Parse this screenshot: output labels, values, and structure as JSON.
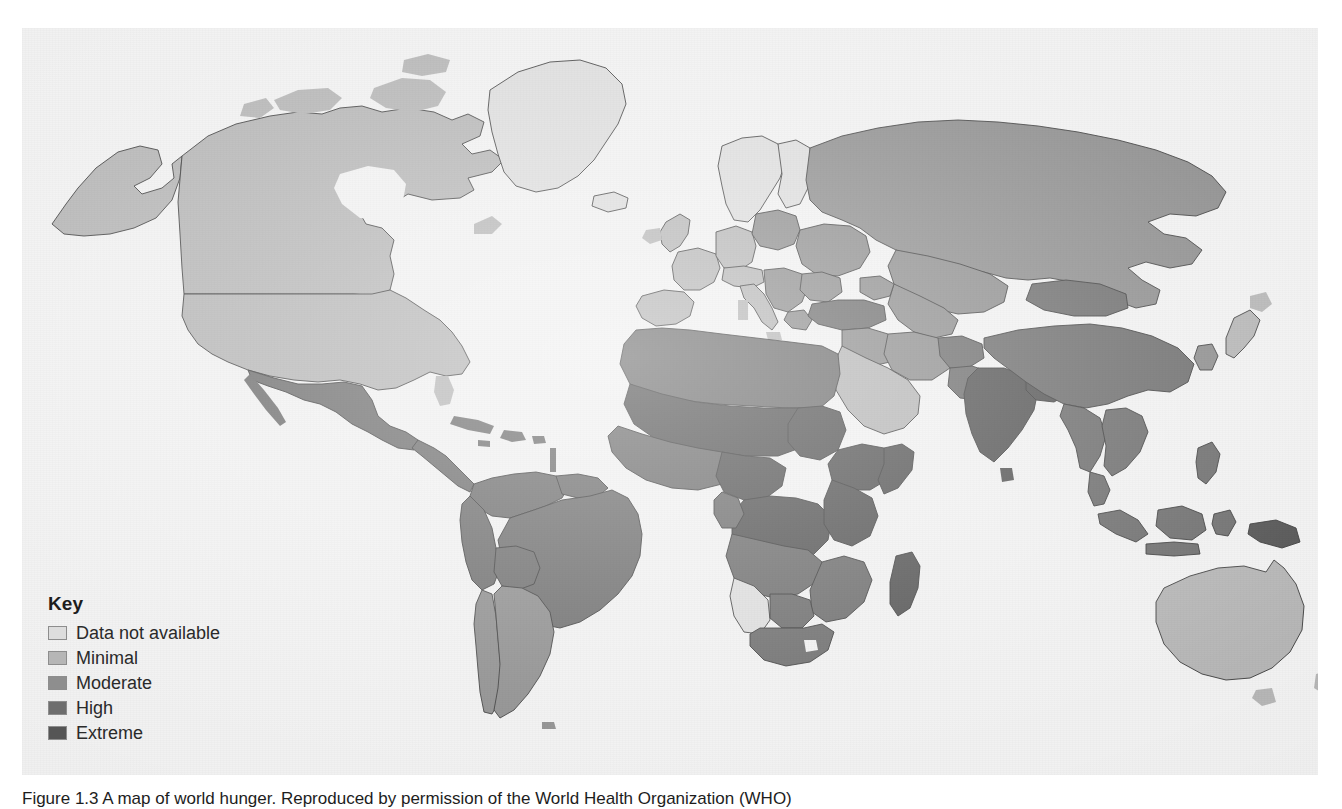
{
  "figure": {
    "caption": "Figure 1.3 A map of world hunger. Reproduced by permission of the World Health Organization (WHO)"
  },
  "legend": {
    "title": "Key",
    "items": [
      {
        "label": "Data not available",
        "color": "#dddddd"
      },
      {
        "label": "Minimal",
        "color": "#b6b6b6"
      },
      {
        "label": "Moderate",
        "color": "#8e8e8e"
      },
      {
        "label": "High",
        "color": "#6e6e6e"
      },
      {
        "label": "Extreme",
        "color": "#555555"
      }
    ]
  },
  "map": {
    "type": "choropleth-world",
    "background_color": "#f1f1f1",
    "ocean_color": "#f1f1f1",
    "border_color": "#3a3a3a",
    "categories": [
      "Data not available",
      "Minimal",
      "Moderate",
      "High",
      "Extreme"
    ],
    "regions": [
      {
        "name": "Greenland",
        "category": "Data not available"
      },
      {
        "name": "Iceland",
        "category": "Data not available"
      },
      {
        "name": "Canada",
        "category": "Minimal"
      },
      {
        "name": "Alaska",
        "category": "Minimal"
      },
      {
        "name": "United States",
        "category": "Minimal"
      },
      {
        "name": "Mexico",
        "category": "High"
      },
      {
        "name": "Central America",
        "category": "High"
      },
      {
        "name": "Caribbean",
        "category": "High"
      },
      {
        "name": "Venezuela",
        "category": "High"
      },
      {
        "name": "Colombia",
        "category": "High"
      },
      {
        "name": "Brazil",
        "category": "High"
      },
      {
        "name": "Peru",
        "category": "High"
      },
      {
        "name": "Bolivia",
        "category": "High"
      },
      {
        "name": "Chile",
        "category": "Moderate"
      },
      {
        "name": "Argentina",
        "category": "Moderate"
      },
      {
        "name": "Scandinavia",
        "category": "Data not available"
      },
      {
        "name": "Western Europe",
        "category": "Minimal"
      },
      {
        "name": "Eastern Europe",
        "category": "Moderate"
      },
      {
        "name": "Balkans",
        "category": "Moderate"
      },
      {
        "name": "Russia",
        "category": "Moderate"
      },
      {
        "name": "Turkey",
        "category": "High"
      },
      {
        "name": "North Africa",
        "category": "High"
      },
      {
        "name": "Sahel",
        "category": "Extreme"
      },
      {
        "name": "West Africa",
        "category": "High"
      },
      {
        "name": "Central Africa",
        "category": "Extreme"
      },
      {
        "name": "East Africa",
        "category": "Extreme"
      },
      {
        "name": "Southern Africa",
        "category": "High"
      },
      {
        "name": "Namibia",
        "category": "Data not available"
      },
      {
        "name": "Madagascar",
        "category": "Extreme"
      },
      {
        "name": "Arabian Peninsula",
        "category": "Minimal"
      },
      {
        "name": "Iran",
        "category": "Moderate"
      },
      {
        "name": "Central Asia",
        "category": "Moderate"
      },
      {
        "name": "China",
        "category": "High"
      },
      {
        "name": "Mongolia",
        "category": "High"
      },
      {
        "name": "India",
        "category": "Extreme"
      },
      {
        "name": "Pakistan",
        "category": "High"
      },
      {
        "name": "Southeast Asia",
        "category": "High"
      },
      {
        "name": "Indonesia",
        "category": "High"
      },
      {
        "name": "Philippines",
        "category": "High"
      },
      {
        "name": "Japan",
        "category": "Minimal"
      },
      {
        "name": "Australia",
        "category": "Minimal"
      },
      {
        "name": "New Zealand",
        "category": "Minimal"
      }
    ]
  }
}
